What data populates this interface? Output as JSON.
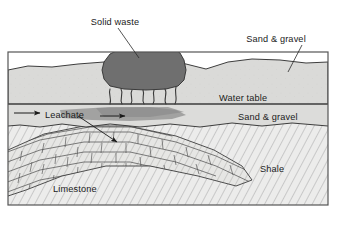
{
  "figure": {
    "type": "geological-cross-section",
    "title_text": "",
    "background_color": "#ffffff",
    "frame": {
      "x": 8,
      "y": 52,
      "width": 320,
      "height": 153,
      "border_color": "#555555"
    }
  },
  "labels": {
    "solid_waste": "Solid waste",
    "sand_gravel_top": "Sand & gravel",
    "water_table": "Water table",
    "sand_gravel_saturated": "Sand & gravel",
    "leachate": "Leachate",
    "limestone": "Limestone",
    "shale": "Shale"
  },
  "layers": [
    {
      "name": "unsaturated-sand-gravel",
      "label": "Sand & gravel",
      "fill": "#d9d9d7",
      "zone": "unsaturated"
    },
    {
      "name": "saturated-sand-gravel",
      "label": "Sand & gravel",
      "fill": "#dededc",
      "zone": "saturated"
    },
    {
      "name": "limestone-bedrock",
      "label": "Limestone",
      "fill": "#e4e4e2",
      "pattern": "blocky-beds"
    },
    {
      "name": "shale-bedrock",
      "label": "Shale",
      "fill": "#eaeae8",
      "pattern": "diagonal-hatch"
    }
  ],
  "features": [
    {
      "name": "solid-waste-mass",
      "label": "Solid waste",
      "fill": "#6f6f6f"
    },
    {
      "name": "leachate-plume",
      "label": "Leachate",
      "fill": "#9a9a9a"
    },
    {
      "name": "water-table-line",
      "label": "Water table"
    }
  ],
  "annotations": {
    "flow_arrow_direction": "right",
    "leachate_arrow_direction": "down-right",
    "solid_waste_leader": "down-right",
    "sand_gravel_leader": "down-left"
  },
  "colors": {
    "waste": "#6f6f6f",
    "plume": "#9b9b9b",
    "upper_sand": "#d9d9d7",
    "saturated_sand": "#dcdcda",
    "bedrock": "#e8e8e6",
    "ink": "#1a1a1a",
    "frame": "#555555"
  }
}
